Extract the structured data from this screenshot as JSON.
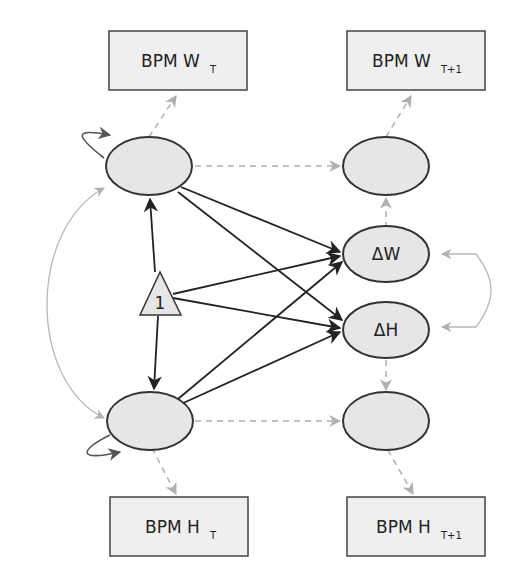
{
  "diagram": {
    "type": "path-model",
    "observed": [
      {
        "id": "bpm_w_t",
        "label": "BPM W",
        "sub": "T"
      },
      {
        "id": "bpm_w_t1",
        "label": "BPM W",
        "sub": "T+1"
      },
      {
        "id": "bpm_h_t",
        "label": "BPM H",
        "sub": "T"
      },
      {
        "id": "bpm_h_t1",
        "label": "BPM H",
        "sub": "T+1"
      }
    ],
    "latent": [
      {
        "id": "w_t",
        "label": ""
      },
      {
        "id": "w_t1",
        "label": ""
      },
      {
        "id": "delta_w",
        "label": "ΔW"
      },
      {
        "id": "delta_h",
        "label": "ΔH"
      },
      {
        "id": "h_t",
        "label": ""
      },
      {
        "id": "h_t1",
        "label": ""
      }
    ],
    "constant": {
      "id": "intercept",
      "label": "1"
    },
    "paths": [
      {
        "from": "intercept",
        "to": "w_t",
        "style": "solid"
      },
      {
        "from": "intercept",
        "to": "h_t",
        "style": "solid"
      },
      {
        "from": "intercept",
        "to": "delta_w",
        "style": "solid"
      },
      {
        "from": "intercept",
        "to": "delta_h",
        "style": "solid"
      },
      {
        "from": "w_t",
        "to": "delta_w",
        "style": "solid"
      },
      {
        "from": "w_t",
        "to": "delta_h",
        "style": "solid"
      },
      {
        "from": "h_t",
        "to": "delta_w",
        "style": "solid"
      },
      {
        "from": "h_t",
        "to": "delta_h",
        "style": "solid"
      },
      {
        "from": "w_t",
        "to": "bpm_w_t",
        "style": "dashed"
      },
      {
        "from": "w_t",
        "to": "w_t1",
        "style": "dashed"
      },
      {
        "from": "delta_w",
        "to": "w_t1",
        "style": "dashed"
      },
      {
        "from": "w_t1",
        "to": "bpm_w_t1",
        "style": "dashed"
      },
      {
        "from": "h_t",
        "to": "bpm_h_t",
        "style": "dashed"
      },
      {
        "from": "h_t",
        "to": "h_t1",
        "style": "dashed"
      },
      {
        "from": "delta_h",
        "to": "h_t1",
        "style": "dashed"
      },
      {
        "from": "h_t1",
        "to": "bpm_h_t1",
        "style": "dashed"
      }
    ],
    "covariances": [
      {
        "between": [
          "w_t",
          "h_t"
        ]
      },
      {
        "between": [
          "delta_w",
          "delta_h"
        ]
      }
    ],
    "variances": [
      "w_t",
      "h_t"
    ]
  }
}
